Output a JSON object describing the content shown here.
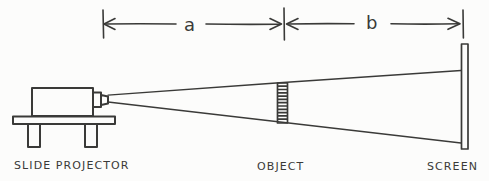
{
  "colors": {
    "ink": "#3a3a38",
    "paper": "#fcfcfb"
  },
  "dimension": {
    "a_label": "a",
    "b_label": "b"
  },
  "labels": {
    "projector": "SLIDE PROJECTOR",
    "object": "OBJECT",
    "screen": "SCREEN"
  }
}
